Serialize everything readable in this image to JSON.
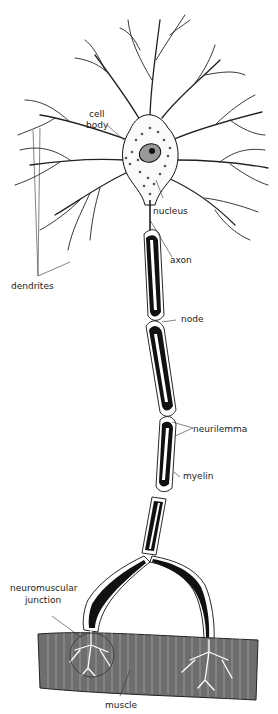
{
  "labels": {
    "cell_body_line1": "cell",
    "cell_body_line2": "body",
    "nucleus": "nucleus",
    "axon": "axon",
    "dendrites": "dendrites",
    "node": "node",
    "neurilemma": "neurilemma",
    "myelin": "myelin",
    "nmj_line1": "neuromuscular",
    "nmj_line2": "junction",
    "muscle": "muscle"
  },
  "colors": {
    "background": "#ffffff",
    "ink": "#111111",
    "muscle_fill": "#6e6e6e",
    "muscle_stripe": "#9a9a9a",
    "cell_dots": "#555555"
  }
}
